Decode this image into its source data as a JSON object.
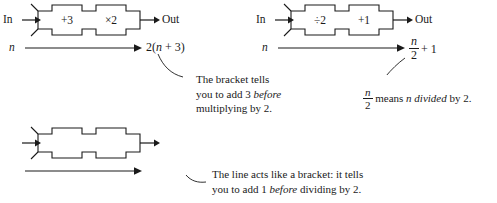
{
  "page": {
    "width": 497,
    "height": 203,
    "background": "#ffffff",
    "ink": "#1a1a1a"
  },
  "labels": {
    "in": "In",
    "out": "Out",
    "variable": "n"
  },
  "machines": [
    {
      "id": "machine-top-left",
      "operations": [
        "+3",
        "×2"
      ],
      "input_label": "In",
      "output_label": "Out",
      "flow_variable": "n",
      "result": {
        "kind": "inline",
        "text": "2(n + 3)",
        "parts": [
          {
            "text": "2(",
            "italic": false
          },
          {
            "text": "n",
            "italic": true
          },
          {
            "text": " + 3)",
            "italic": false
          }
        ]
      }
    },
    {
      "id": "machine-top-right",
      "operations": [
        "÷2",
        "+1"
      ],
      "input_label": "In",
      "output_label": "Out",
      "flow_variable": "n",
      "result": {
        "kind": "fraction-plus",
        "numerator": "n",
        "denominator": "2",
        "trailing": "+ 1",
        "text": "n/2 + 1"
      }
    },
    {
      "id": "machine-bottom-left",
      "operations": [
        "+1",
        "÷2"
      ],
      "input_label": "In",
      "output_label": "Out",
      "flow_variable": "n",
      "result": {
        "kind": "fraction",
        "numerator": "n + 1",
        "denominator": "2",
        "text": "(n + 1)/2"
      }
    }
  ],
  "annotations": [
    {
      "id": "note-bracket-multiply",
      "lines": [
        [
          {
            "text": "The bracket tells",
            "italic": false
          }
        ],
        [
          {
            "text": "you to add 3 ",
            "italic": false
          },
          {
            "text": "before",
            "italic": true
          }
        ],
        [
          {
            "text": "multiplying by 2.",
            "italic": false
          }
        ]
      ],
      "plain": "The bracket tells you to add 3 before multiplying by 2."
    },
    {
      "id": "note-fraction-meaning",
      "lines": [
        [
          {
            "text": "n",
            "italic": true,
            "fraction": true,
            "denominator": "2"
          },
          {
            "text": " means ",
            "italic": false
          },
          {
            "text": "n divided",
            "italic": true
          },
          {
            "text": " by 2.",
            "italic": false
          }
        ]
      ],
      "plain": "n/2 means n divided by 2."
    },
    {
      "id": "note-line-bracket",
      "lines": [
        [
          {
            "text": "The line acts like a bracket: it tells",
            "italic": false
          }
        ],
        [
          {
            "text": "you to add 1 ",
            "italic": false
          },
          {
            "text": "before",
            "italic": true
          },
          {
            "text": " dividing by 2.",
            "italic": false
          }
        ]
      ],
      "plain": "The line acts like a bracket: it tells you to add 1 before dividing by 2."
    }
  ]
}
